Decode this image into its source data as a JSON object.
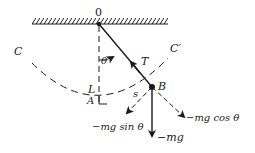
{
  "diagram": {
    "colors": {
      "ink": "#1a1a1a",
      "background": "#ffffff"
    },
    "labels": {
      "pivot": "0",
      "theta": "θ",
      "tension": "T",
      "length": "L",
      "lowest_point": "A",
      "bob": "B",
      "arc_length": "s",
      "arc_left_end": "C",
      "arc_right_end": "C′",
      "weight": "−mg",
      "tangential": "−mg sin θ",
      "radial": "−mg cos θ"
    },
    "elements": [
      {
        "id": "ceiling",
        "type": "hatched-support"
      },
      {
        "id": "vertical-reference",
        "type": "dashed-line",
        "from": "O",
        "to": "A"
      },
      {
        "id": "string",
        "type": "line",
        "from": "O",
        "to": "B"
      },
      {
        "id": "arc",
        "type": "dashed-arc",
        "from": "C",
        "via": "A",
        "to": "C′"
      },
      {
        "id": "tension-arrow",
        "type": "arrow",
        "along": "string",
        "label": "T"
      },
      {
        "id": "weight-arrow",
        "type": "arrow",
        "direction": "down",
        "label": "−mg"
      },
      {
        "id": "tangential-arrow",
        "type": "arrow",
        "direction": "down-left",
        "label": "−mg sin θ"
      },
      {
        "id": "radial-arrow",
        "type": "arrow",
        "direction": "down-right",
        "label": "−mg cos θ"
      }
    ]
  }
}
